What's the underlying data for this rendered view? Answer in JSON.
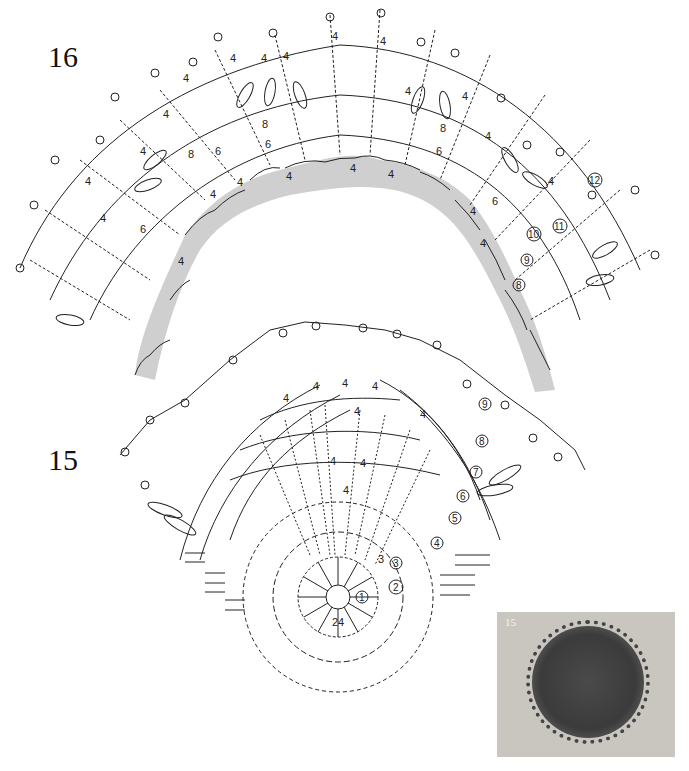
{
  "figures": [
    {
      "id": "16",
      "label": "16",
      "description": "Semicircular crochet doily edge chart with shaded base rows",
      "round_labels": [
        "8",
        "9",
        "10",
        "11",
        "12"
      ],
      "repeat_labels": [
        "4",
        "6",
        "8"
      ]
    },
    {
      "id": "15",
      "label": "15",
      "description": "Circular crochet doily chart, half shown",
      "round_labels": [
        "1",
        "2",
        "3",
        "4",
        "5",
        "6",
        "7",
        "8",
        "9"
      ],
      "center_count": "24",
      "repeat_labels": [
        "3",
        "4"
      ]
    }
  ],
  "photo": {
    "caption": "15",
    "description": "Photo of finished doily 15"
  },
  "colors": {
    "line": "#222222",
    "shade": "#cfcfcf",
    "background": "#ffffff"
  }
}
